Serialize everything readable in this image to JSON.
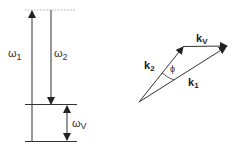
{
  "energy_diagram": {
    "omega1": {
      "symbol": "ω",
      "sub": "1"
    },
    "omega2": {
      "symbol": "ω",
      "sub": "2"
    },
    "omegaV": {
      "symbol": "ω",
      "sub": "V"
    }
  },
  "wavevector_diagram": {
    "k2": {
      "symbol": "k",
      "sub": "2"
    },
    "kV": {
      "symbol": "k",
      "sub": "V"
    },
    "k1": {
      "symbol": "k",
      "sub": "1"
    },
    "angle": "ϕ"
  },
  "colors": {
    "line": "#333333",
    "dotted": "#999999"
  }
}
